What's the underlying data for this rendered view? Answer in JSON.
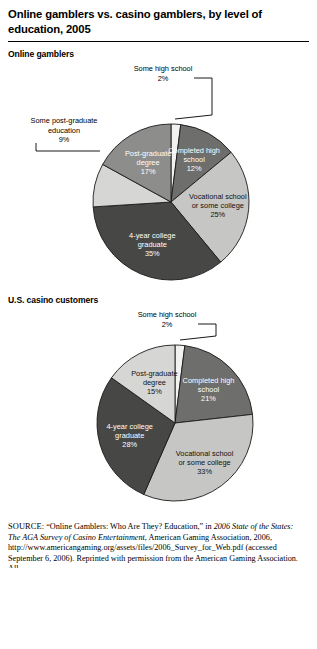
{
  "figure": {
    "title": "Online gamblers vs. casino gamblers, by level of education, 2005",
    "chart1_heading": "Online gamblers",
    "chart2_heading": "U.S. casino customers"
  },
  "colors": {
    "white_slice": "#f2f2f0",
    "light_gray": "#c6c6c4",
    "light_gray2": "#d6d6d4",
    "medium_gray": "#8d8d8b",
    "medium_dark_gray": "#6e6e6c",
    "dark_gray": "#474745",
    "outline": "#1a1a1a",
    "text": "#000000"
  },
  "chart_data": [
    {
      "type": "pie",
      "title": "Online gamblers",
      "id": "online-gamblers",
      "legend": "none",
      "start_angle_deg": 0,
      "direction": "clockwise",
      "categories": [
        "Some high school",
        "Completed high school",
        "Vocational school or some college",
        "4-year college graduate",
        "Some post-graduate education",
        "Post-graduate degree"
      ],
      "values": [
        2,
        12,
        25,
        35,
        9,
        17
      ],
      "units": "percent",
      "slices": [
        {
          "label": "Some high school",
          "value": 2,
          "value_text": "2%",
          "label_lines": [
            "Some high school",
            "2%"
          ],
          "placement": "callout",
          "color": "#f2f2f0",
          "text_color": "#000000"
        },
        {
          "label": "Completed high school",
          "value": 12,
          "value_text": "12%",
          "label_lines": [
            "Completed high",
            "school",
            "12%"
          ],
          "placement": "inside",
          "color": "#6e6e6c",
          "text_color": "#ffffff"
        },
        {
          "label": "Vocational school or some college",
          "value": 25,
          "value_text": "25%",
          "label_lines": [
            "Vocational school",
            "or some college",
            "25%"
          ],
          "placement": "inside",
          "color": "#c6c6c4",
          "text_color": "#111111"
        },
        {
          "label": "4-year college graduate",
          "value": 35,
          "value_text": "35%",
          "label_lines": [
            "4-year college",
            "graduate",
            "35%"
          ],
          "placement": "inside",
          "color": "#474745",
          "text_color": "#ffffff"
        },
        {
          "label": "Some post-graduate education",
          "value": 9,
          "value_text": "9%",
          "label_lines": [
            "Some post-graduate",
            "education",
            "9%"
          ],
          "placement": "callout",
          "color": "#d6d6d4",
          "text_color": "#000000"
        },
        {
          "label": "Post-graduate degree",
          "value": 17,
          "value_text": "17%",
          "label_lines": [
            "Post-graduate",
            "degree",
            "17%"
          ],
          "placement": "inside",
          "color": "#8d8d8b",
          "text_color": "#ffffff"
        }
      ]
    },
    {
      "type": "pie",
      "title": "U.S. casino customers",
      "id": "casino-customers",
      "legend": "none",
      "start_angle_deg": 0,
      "direction": "clockwise",
      "categories": [
        "Some high school",
        "Completed high school",
        "Vocational school or some college",
        "4-year college graduate",
        "Post-graduate degree"
      ],
      "values": [
        2,
        21,
        33,
        28,
        15
      ],
      "units": "percent",
      "slices": [
        {
          "label": "Some high school",
          "value": 2,
          "value_text": "2%",
          "label_lines": [
            "Some high school",
            "2%"
          ],
          "placement": "callout",
          "color": "#f2f2f0",
          "text_color": "#000000"
        },
        {
          "label": "Completed high school",
          "value": 21,
          "value_text": "21%",
          "label_lines": [
            "Completed high",
            "school",
            "21%"
          ],
          "placement": "inside",
          "color": "#6e6e6c",
          "text_color": "#ffffff"
        },
        {
          "label": "Vocational school or some college",
          "value": 33,
          "value_text": "33%",
          "label_lines": [
            "Vocational school",
            "or some college",
            "33%"
          ],
          "placement": "inside",
          "color": "#c6c6c4",
          "text_color": "#111111"
        },
        {
          "label": "4-year college graduate",
          "value": 28,
          "value_text": "28%",
          "label_lines": [
            "4-year college",
            "graduate",
            "28%"
          ],
          "placement": "inside",
          "color": "#474745",
          "text_color": "#ffffff"
        },
        {
          "label": "Post-graduate degree",
          "value": 15,
          "value_text": "15%",
          "label_lines": [
            "Post-graduate",
            "degree",
            "15%"
          ],
          "placement": "inside",
          "color": "#d6d6d4",
          "text_color": "#111111"
        }
      ]
    }
  ],
  "source": {
    "label": "SOURCE:",
    "lines": [
      "“Online Gamblers: Who Are They? Education,” in 2006",
      "State of the States: The AGA Survey of Casino Entertainment, American",
      "Gaming Association, 2006, http://www.americangaming.org/assets/",
      "files/2006_Survey_for_Web.pdf (accessed September 6, 2006).",
      "Reprinted with permission from the American Gaming Association. All"
    ],
    "full_text": "SOURCE: “Online Gamblers: Who Are They? Education,” in 2006 State of the States: The AGA Survey of Casino Entertainment, American Gaming Association, 2006, http://www.americangaming.org/assets/files/2006_Survey_for_Web.pdf (accessed September 6, 2006). Reprinted with permission from the American Gaming Association. All"
  }
}
